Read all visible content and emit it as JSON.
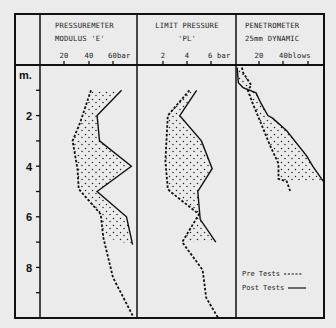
{
  "chart_data": [
    {
      "type": "line",
      "title": "PRESSUREMETER MODULUS 'E'",
      "title_lines": [
        "PRESSUREMETER",
        "MODULUS  'E'"
      ],
      "xlabel": "bar",
      "ylabel": "m.",
      "x_ticks": [
        "20",
        "40",
        "60bar"
      ],
      "x_tick_values": [
        20,
        40,
        60
      ],
      "xlim": [
        0,
        70
      ],
      "ylim": [
        0,
        10
      ],
      "y_inverted": true,
      "fill_between_series": true,
      "series": [
        {
          "name": "Pre Tests",
          "style": "dashed",
          "points": [
            [
              42,
              1.0
            ],
            [
              33,
              2.3
            ],
            [
              27,
              3.0
            ],
            [
              31,
              4.1
            ],
            [
              32,
              4.9
            ],
            [
              50,
              5.9
            ],
            [
              52,
              6.8
            ],
            [
              60,
              8.4
            ],
            [
              76,
              9.9
            ]
          ]
        },
        {
          "name": "Post Tests",
          "style": "solid",
          "points": [
            [
              67,
              1.0
            ],
            [
              47,
              2.0
            ],
            [
              49,
              3.0
            ],
            [
              75,
              4.0
            ],
            [
              47,
              5.0
            ],
            [
              71,
              6.0
            ],
            [
              76,
              7.1
            ]
          ]
        }
      ]
    },
    {
      "type": "line",
      "title": "LIMIT PRESSURE 'PL'",
      "title_lines": [
        "LIMIT PRESSURE",
        "'PL'"
      ],
      "xlabel": "bar",
      "ylabel": "m.",
      "x_ticks": [
        "2",
        "4",
        "6 bar"
      ],
      "x_tick_values": [
        2,
        4,
        6
      ],
      "xlim": [
        0,
        8
      ],
      "ylim": [
        0,
        10
      ],
      "y_inverted": true,
      "fill_between_series": true,
      "series": [
        {
          "name": "Pre Tests",
          "style": "dashed",
          "points": [
            [
              4.2,
              1.0
            ],
            [
              2.4,
              2.0
            ],
            [
              2.2,
              3.8
            ],
            [
              2.4,
              4.9
            ],
            [
              2.6,
              5.0
            ],
            [
              5.0,
              5.9
            ],
            [
              3.6,
              7.0
            ],
            [
              5.3,
              8.1
            ],
            [
              5.6,
              9.2
            ],
            [
              6.6,
              10.0
            ]
          ]
        },
        {
          "name": "Post Tests",
          "style": "solid",
          "points": [
            [
              4.8,
              1.0
            ],
            [
              3.4,
              2.0
            ],
            [
              5.2,
              3.0
            ],
            [
              6.1,
              4.1
            ],
            [
              4.9,
              5.0
            ],
            [
              5.1,
              6.1
            ],
            [
              6.4,
              7.0
            ]
          ]
        }
      ]
    },
    {
      "type": "line",
      "title": "PENETROMETER 25mm DYNAMIC",
      "title_lines": [
        "PENETROMETER",
        "25mm DYNAMIC"
      ],
      "xlabel": "blows",
      "ylabel": "m.",
      "x_ticks": [
        "20",
        "40blows"
      ],
      "x_tick_values": [
        20,
        40,
        60
      ],
      "xlim": [
        0,
        75
      ],
      "ylim": [
        0,
        10
      ],
      "y_inverted": true,
      "fill_between_series": true,
      "series": [
        {
          "name": "Pre Tests",
          "style": "dashed",
          "points": [
            [
              5,
              0.1
            ],
            [
              6,
              0.3
            ],
            [
              13,
              0.8
            ],
            [
              10,
              1.0
            ],
            [
              14,
              1.5
            ],
            [
              22,
              2.4
            ],
            [
              29,
              3.2
            ],
            [
              36,
              3.9
            ],
            [
              36,
              4.5
            ],
            [
              43,
              4.6
            ],
            [
              46,
              5.0
            ]
          ]
        },
        {
          "name": "Post Tests",
          "style": "solid",
          "points": [
            [
              1,
              0.1
            ],
            [
              2,
              0.7
            ],
            [
              6,
              0.9
            ],
            [
              17,
              1.1
            ],
            [
              21,
              1.5
            ],
            [
              27,
              2.0
            ],
            [
              31,
              2.1
            ],
            [
              43,
              2.6
            ],
            [
              60,
              3.6
            ],
            [
              65,
              4.0
            ],
            [
              74,
              4.6
            ]
          ]
        }
      ]
    }
  ],
  "depth_axis": {
    "unit_label": "m.",
    "labels": [
      "2",
      "4",
      "6",
      "8"
    ],
    "tick_depths": [
      1,
      2,
      3,
      4,
      5,
      6,
      7,
      8,
      9
    ]
  },
  "legend": {
    "pre_label": "Pre Tests",
    "post_label": "Post Tests"
  },
  "colors": {
    "background": "#ebebeb",
    "ink": "#111111"
  }
}
